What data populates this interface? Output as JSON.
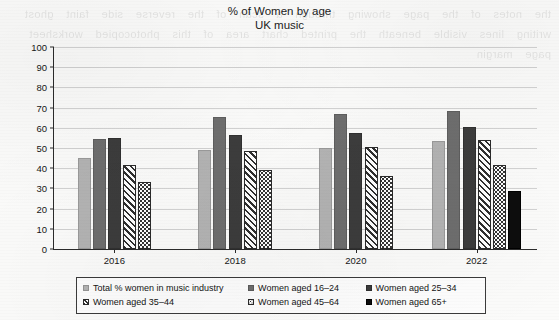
{
  "chart_data": {
    "type": "bar",
    "title": "% of Women by age",
    "subtitle": "UK music",
    "xlabel": "",
    "ylabel": "",
    "ylim": [
      0,
      100
    ],
    "ytick_step": 10,
    "yticks": [
      "0",
      "10",
      "20",
      "30",
      "40",
      "50",
      "60",
      "70",
      "80",
      "90",
      "100"
    ],
    "categories": [
      "2016",
      "2018",
      "2020",
      "2022"
    ],
    "grid": true,
    "legend_position": "bottom",
    "series": [
      {
        "name": "Total % women in music industry",
        "key": "total",
        "values": [
          45,
          49,
          50,
          53.5
        ]
      },
      {
        "name": "Women aged 16–24",
        "key": "a1624",
        "values": [
          54.5,
          65.5,
          67,
          68.5
        ]
      },
      {
        "name": "Women aged 25–34",
        "key": "a2534",
        "values": [
          55,
          56.5,
          57.5,
          60.5
        ]
      },
      {
        "name": "Women aged 35–44",
        "key": "a3544",
        "values": [
          41.5,
          48.5,
          50.5,
          54
        ]
      },
      {
        "name": "Women aged 45–64",
        "key": "a4564",
        "values": [
          33,
          39,
          36,
          41.5
        ]
      },
      {
        "name": "Women aged 65+",
        "key": "a65",
        "values": [
          null,
          null,
          null,
          28.5
        ]
      }
    ]
  },
  "legend": {
    "items": [
      {
        "label": "Total % women in music industry",
        "key": "total"
      },
      {
        "label": "Women aged 16–24",
        "key": "a1624"
      },
      {
        "label": "Women aged 25–34",
        "key": "a2534"
      },
      {
        "label": "Women aged 35–44",
        "key": "a3544"
      },
      {
        "label": "Women aged 45–64",
        "key": "a4564"
      },
      {
        "label": "Women aged 65+",
        "key": "a65"
      }
    ]
  },
  "colors": {
    "total": "#b3b3b3",
    "a1624": "#6e6e6e",
    "a2534": "#3c3c3c",
    "a3544": "#ffffff",
    "a4564": "#ffffff",
    "a65": "#0d0d0d",
    "axis": "#2b2b2b",
    "gridline": "#d2d2d2",
    "page_background": "#fbfbfa"
  },
  "artifact": {
    "bleed_through_text": "the notes of the page showing through a scan of the reverse side faint ghost writing lines visible beneath the printed chart area of this photocopied worksheet page margin"
  }
}
